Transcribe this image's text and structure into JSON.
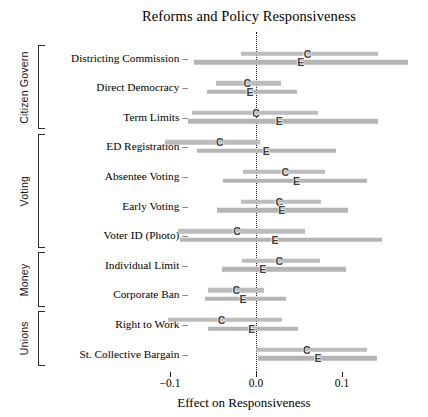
{
  "chart_data": {
    "type": "scatter",
    "title": "Reforms and Policy Responsiveness",
    "xlabel": "Effect on Responsiveness",
    "ylabel": "",
    "xlim": [
      -0.12,
      0.13
    ],
    "xticks": [
      -0.1,
      0.0,
      0.1
    ],
    "xticklabels": [
      "−0.1",
      "0.0",
      "0.1"
    ],
    "grid": false,
    "legend_position": "none",
    "zero_reference_line": 0.0,
    "series": [
      {
        "name": "C",
        "marker_label": "C",
        "description": "Citizen estimate"
      },
      {
        "name": "E",
        "marker_label": "E",
        "description": "Elite estimate"
      }
    ],
    "groups": [
      {
        "label": "Citizen Govern",
        "rows": [
          "Districting Commission",
          "Direct Democracy",
          "Term Limits"
        ]
      },
      {
        "label": "Voting",
        "rows": [
          "ED Registration",
          "Absentee Voting",
          "Early Voting",
          "Voter ID (Photo)"
        ]
      },
      {
        "label": "Money",
        "rows": [
          "Individual Limit",
          "Corporate Ban"
        ]
      },
      {
        "label": "Unions",
        "rows": [
          "Right to Work",
          "St. Collective Bargain"
        ]
      }
    ],
    "categories": [
      "Districting Commission",
      "Direct Democracy",
      "Term Limits",
      "ED Registration",
      "Absentee Voting",
      "Early Voting",
      "Voter ID (Photo)",
      "Individual Limit",
      "Corporate Ban",
      "Right to Work",
      "St. Collective Bargain"
    ],
    "rows": [
      {
        "category": "Districting Commission",
        "group": "Citizen Govern",
        "C": {
          "estimate": 0.06,
          "low": -0.017,
          "high": 0.142
        },
        "E": {
          "estimate": 0.052,
          "low": -0.072,
          "high": 0.177
        }
      },
      {
        "category": "Direct Democracy",
        "group": "Citizen Govern",
        "C": {
          "estimate": -0.01,
          "low": -0.047,
          "high": 0.029
        },
        "E": {
          "estimate": -0.007,
          "low": -0.057,
          "high": 0.048
        }
      },
      {
        "category": "Term Limits",
        "group": "Citizen Govern",
        "C": {
          "estimate": 0.0,
          "low": -0.074,
          "high": 0.072
        },
        "E": {
          "estimate": 0.027,
          "low": -0.079,
          "high": 0.142
        }
      },
      {
        "category": "ED Registration",
        "group": "Voting",
        "C": {
          "estimate": -0.042,
          "low": -0.106,
          "high": 0.005
        },
        "E": {
          "estimate": 0.012,
          "low": -0.069,
          "high": 0.093
        }
      },
      {
        "category": "Absentee Voting",
        "group": "Voting",
        "C": {
          "estimate": 0.034,
          "low": -0.015,
          "high": 0.08
        },
        "E": {
          "estimate": 0.047,
          "low": -0.038,
          "high": 0.129
        }
      },
      {
        "category": "Early Voting",
        "group": "Voting",
        "C": {
          "estimate": 0.027,
          "low": -0.017,
          "high": 0.076
        },
        "E": {
          "estimate": 0.03,
          "low": -0.045,
          "high": 0.107
        }
      },
      {
        "category": "Voter ID (Photo)",
        "group": "Voting",
        "C": {
          "estimate": -0.022,
          "low": -0.091,
          "high": 0.057
        },
        "E": {
          "estimate": 0.022,
          "low": -0.088,
          "high": 0.147
        }
      },
      {
        "category": "Individual Limit",
        "group": "Money",
        "C": {
          "estimate": 0.027,
          "low": -0.016,
          "high": 0.074
        },
        "E": {
          "estimate": 0.008,
          "low": -0.04,
          "high": 0.105
        }
      },
      {
        "category": "Corporate Ban",
        "group": "Money",
        "C": {
          "estimate": -0.023,
          "low": -0.056,
          "high": 0.009
        },
        "E": {
          "estimate": -0.015,
          "low": -0.059,
          "high": 0.035
        }
      },
      {
        "category": "Right to Work",
        "group": "Unions",
        "C": {
          "estimate": -0.04,
          "low": -0.102,
          "high": 0.03
        },
        "E": {
          "estimate": -0.005,
          "low": -0.056,
          "high": 0.049
        }
      },
      {
        "category": "St. Collective Bargain",
        "group": "Unions",
        "C": {
          "estimate": 0.059,
          "low": 0.0,
          "high": 0.129
        },
        "E": {
          "estimate": 0.072,
          "low": 0.002,
          "high": 0.141
        }
      }
    ]
  },
  "colors": {
    "bar": "#bcbcbc",
    "marker": "#3d3d3d",
    "axis": "#1a1a1a",
    "background": "#ffffff"
  }
}
